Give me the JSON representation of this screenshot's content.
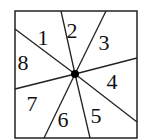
{
  "diagram": {
    "type": "spinner-square",
    "square": {
      "x": 15,
      "y": 11,
      "w": 122,
      "h": 127
    },
    "center": {
      "x": 75,
      "y": 74,
      "r": 4
    },
    "lines": [
      {
        "x2": 61,
        "y2": 11
      },
      {
        "x2": 106,
        "y2": 11
      },
      {
        "x2": 137,
        "y2": 58
      },
      {
        "x2": 137,
        "y2": 122
      },
      {
        "x2": 90,
        "y2": 138
      },
      {
        "x2": 44,
        "y2": 138
      },
      {
        "x2": 15,
        "y2": 89
      },
      {
        "x2": 15,
        "y2": 29
      }
    ],
    "sectors": [
      {
        "label": "1",
        "x": 43,
        "y": 45
      },
      {
        "label": "2",
        "x": 72,
        "y": 38
      },
      {
        "label": "3",
        "x": 104,
        "y": 50
      },
      {
        "label": "4",
        "x": 112,
        "y": 89
      },
      {
        "label": "5",
        "x": 96,
        "y": 123
      },
      {
        "label": "6",
        "x": 63,
        "y": 127
      },
      {
        "label": "7",
        "x": 32,
        "y": 111
      },
      {
        "label": "8",
        "x": 23,
        "y": 70
      }
    ],
    "stroke_color": "#222222"
  }
}
